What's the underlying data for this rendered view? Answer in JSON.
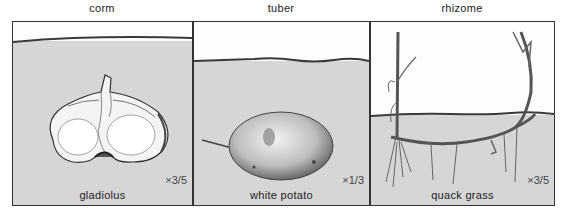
{
  "figure": {
    "panels": [
      {
        "title": "corm",
        "caption": "gladiolus",
        "scale": "×3/5",
        "illustration": "gladiolus-corm-cross-section"
      },
      {
        "title": "tuber",
        "caption": "white potato",
        "scale": "×1/3",
        "illustration": "potato-tuber"
      },
      {
        "title": "rhizome",
        "caption": "quack grass",
        "scale": "×3/5",
        "illustration": "quack-grass-rhizome"
      }
    ],
    "colors": {
      "soil": "#d6d6d6",
      "air": "#fdfdfd",
      "border": "#333333",
      "soil_line": "#3a3a3a"
    }
  }
}
